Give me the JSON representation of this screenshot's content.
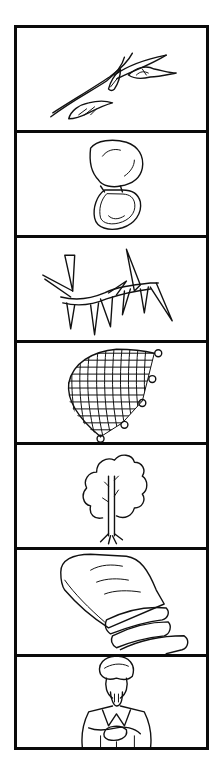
{
  "strip": {
    "frame_color": "#0a0a0a",
    "background": "#ffffff",
    "panels": [
      {
        "index": 1,
        "subject": "twig with buds",
        "icon": "twig-icon"
      },
      {
        "index": 2,
        "subject": "open clam shell",
        "icon": "clam-shell-icon"
      },
      {
        "index": 3,
        "subject": "thorny branch",
        "icon": "thorn-branch-icon"
      },
      {
        "index": 4,
        "subject": "fishing net with floats",
        "icon": "fishing-net-icon"
      },
      {
        "index": 5,
        "subject": "tree",
        "icon": "tree-icon"
      },
      {
        "index": 6,
        "subject": "sliced loaf of bread",
        "icon": "bread-loaf-icon"
      },
      {
        "index": 7,
        "subject": "man in turban and robe",
        "icon": "turbaned-man-icon"
      }
    ]
  }
}
